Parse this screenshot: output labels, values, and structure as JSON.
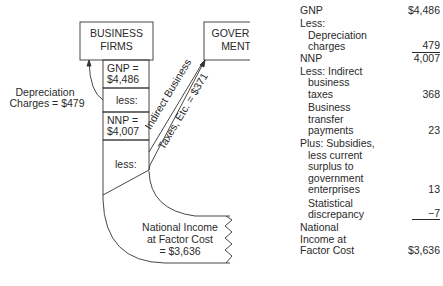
{
  "diagram": {
    "business_firms": [
      "BUSINESS",
      "FIRMS"
    ],
    "government": [
      "GOVERN-",
      "MENT"
    ],
    "gnp_box": [
      "GNP =",
      "$4,486"
    ],
    "less1": "less:",
    "nnp_box": [
      "NNP =",
      "$4,007"
    ],
    "less2": "less:",
    "depreciation_label": [
      "Depreciation",
      "Charges = $479"
    ],
    "indirect_taxes_label": [
      "Indirect Business",
      "Taxes, Etc. = $371"
    ],
    "national_income_label": [
      "National Income",
      "at Factor Cost",
      "= $3,636"
    ]
  },
  "table": {
    "gnp": {
      "label": "GNP",
      "value": "$4,486"
    },
    "less_header": "Less:",
    "depreciation": {
      "label": [
        "Depreciation",
        "charges"
      ],
      "value": "479"
    },
    "nnp": {
      "label": "NNP",
      "value": "4,007"
    },
    "indirect_taxes": {
      "label": [
        "Less: Indirect",
        "business",
        "taxes"
      ],
      "value": "368"
    },
    "transfer_payments": {
      "label": [
        "Business",
        "transfer",
        "payments"
      ],
      "value": "23"
    },
    "subsidies": {
      "label": [
        "Plus: Subsidies,",
        "less current",
        "surplus to",
        "government",
        "enterprises"
      ],
      "value": "13"
    },
    "discrepancy": {
      "label": [
        "Statistical",
        "discrepancy"
      ],
      "value": "−7"
    },
    "national_income": {
      "label": [
        "National",
        "Income at",
        "Factor Cost"
      ],
      "value": "$3,636"
    }
  }
}
